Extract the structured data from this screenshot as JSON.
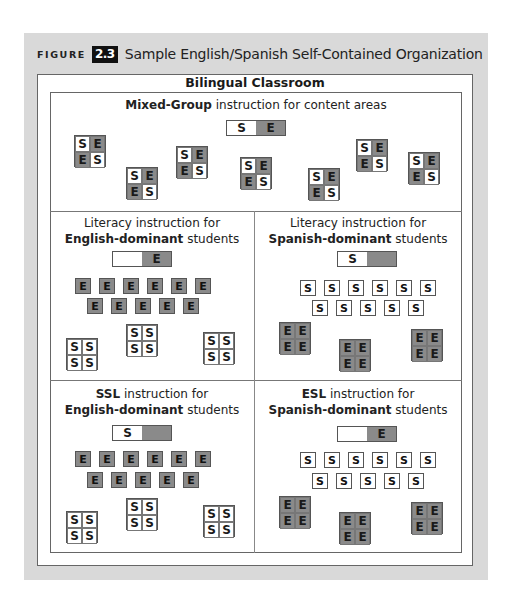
{
  "figure": {
    "label": "FIGURE",
    "number": "2.3",
    "title": "Sample English/Spanish Self-Contained Organization"
  },
  "classroom": {
    "title": "Bilingual Classroom"
  },
  "colors": {
    "english_fill": "#8a8a8a",
    "spanish_fill": "#ffffff",
    "panel_bg": "#d9d9d9"
  },
  "sections": {
    "mixed": {
      "title_bold": "Mixed-Group",
      "title_rest": " instruction for content areas",
      "bar": [
        "S",
        "E"
      ]
    },
    "literacy_english": {
      "line1_bold": "",
      "line1_rest": "Literacy instruction for",
      "line2_bold": "English-dominant",
      "line2_rest": " students",
      "bar": [
        "",
        "E"
      ]
    },
    "literacy_spanish": {
      "line1_bold": "",
      "line1_rest": "Literacy instruction for",
      "line2_bold": "Spanish-dominant",
      "line2_rest": " students",
      "bar": [
        "S",
        ""
      ]
    },
    "ssl_english": {
      "line1_bold": "SSL",
      "line1_rest": " instruction for",
      "line2_bold": "English-dominant",
      "line2_rest": " students",
      "bar": [
        "S",
        ""
      ]
    },
    "esl_spanish": {
      "line1_bold": "ESL",
      "line1_rest": " instruction for",
      "line2_bold": "Spanish-dominant",
      "line2_rest": " students",
      "bar": [
        "",
        "E"
      ]
    }
  },
  "tiles": {
    "E": "E",
    "S": "S"
  }
}
